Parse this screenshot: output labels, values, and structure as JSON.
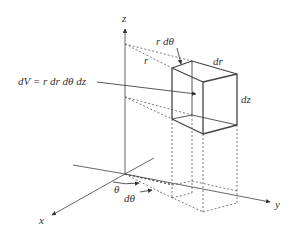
{
  "diagram": {
    "colors": {
      "stroke": "#444444",
      "dashed": "#555555",
      "text": "#333333",
      "background": "#ffffff"
    },
    "labels": {
      "z_axis": "z",
      "x_axis": "x",
      "y_axis": "y",
      "r": "r",
      "r_dtheta": "r dθ",
      "dr": "dr",
      "dz": "dz",
      "dV": "dV = r dr dθ dz",
      "theta": "θ",
      "dtheta": "dθ"
    }
  }
}
